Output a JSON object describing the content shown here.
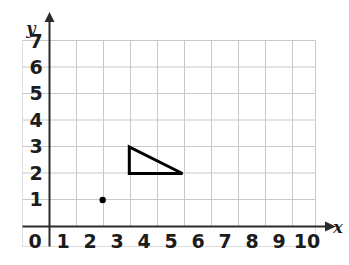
{
  "figure": {
    "kind": "coordinate-grid",
    "background_color": "#ffffff",
    "frame_color": "#d9d9d9",
    "grid_color": "#c9c9c9",
    "axis_color": "#2b2b2b",
    "shape_color": "#000000",
    "point_color": "#000000"
  },
  "axes": {
    "x_label": "x",
    "y_label": "y",
    "origin_label": "0",
    "x_ticks": [
      "1",
      "2",
      "3",
      "4",
      "5",
      "6",
      "7",
      "8",
      "9",
      "10"
    ],
    "y_ticks": [
      "1",
      "2",
      "3",
      "4",
      "5",
      "6",
      "7"
    ],
    "xlim": [
      0,
      10
    ],
    "ylim": [
      0,
      7
    ],
    "x_arrow": "arrow-right",
    "y_arrow": "arrow-up"
  },
  "chart_data": {
    "type": "scatter",
    "title": "",
    "xlabel": "x",
    "ylabel": "y",
    "xlim": [
      0,
      10
    ],
    "ylim": [
      0,
      7
    ],
    "x_ticks": [
      0,
      1,
      2,
      3,
      4,
      5,
      6,
      7,
      8,
      9,
      10
    ],
    "y_ticks": [
      0,
      1,
      2,
      3,
      4,
      5,
      6,
      7
    ],
    "grid": true,
    "legend": false,
    "points": [
      {
        "label": "plotted-point",
        "x": 2,
        "y": 1
      }
    ],
    "shapes": [
      {
        "name": "right-triangle",
        "type": "polygon",
        "closed": true,
        "fill": "none",
        "stroke": "#000000",
        "stroke_width": 3,
        "vertices": [
          {
            "x": 3,
            "y": 3
          },
          {
            "x": 3,
            "y": 2
          },
          {
            "x": 5,
            "y": 2
          }
        ]
      }
    ]
  }
}
